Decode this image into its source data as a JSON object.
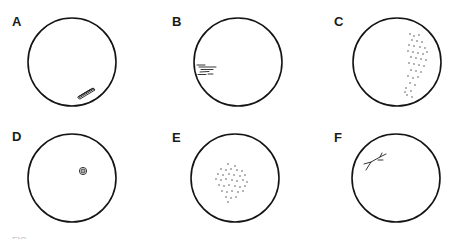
{
  "figure": {
    "caption_fragment": "FIG",
    "panels": [
      {
        "label": "A",
        "pattern": "elongated-oblique-lesion",
        "cx": 72,
        "cy": 62,
        "r": 44,
        "label_x": 12,
        "label_y": 26
      },
      {
        "label": "B",
        "pattern": "horizontal-streaks",
        "cx": 238,
        "cy": 62,
        "r": 44,
        "label_x": 172,
        "label_y": 26
      },
      {
        "label": "C",
        "pattern": "peripheral-dot-cluster",
        "cx": 397,
        "cy": 62,
        "r": 44,
        "label_x": 334,
        "label_y": 26
      },
      {
        "label": "D",
        "pattern": "central-concentric-spot",
        "cx": 72,
        "cy": 178,
        "r": 44,
        "label_x": 12,
        "label_y": 141
      },
      {
        "label": "E",
        "pattern": "central-dot-cluster",
        "cx": 235,
        "cy": 178,
        "r": 44,
        "label_x": 172,
        "label_y": 142
      },
      {
        "label": "F",
        "pattern": "branching-line",
        "cx": 396,
        "cy": 178,
        "r": 44,
        "label_x": 334,
        "label_y": 142
      }
    ]
  },
  "colors": {
    "background": "#ffffff",
    "stroke": "#141414",
    "label": "#1a1a1a"
  }
}
